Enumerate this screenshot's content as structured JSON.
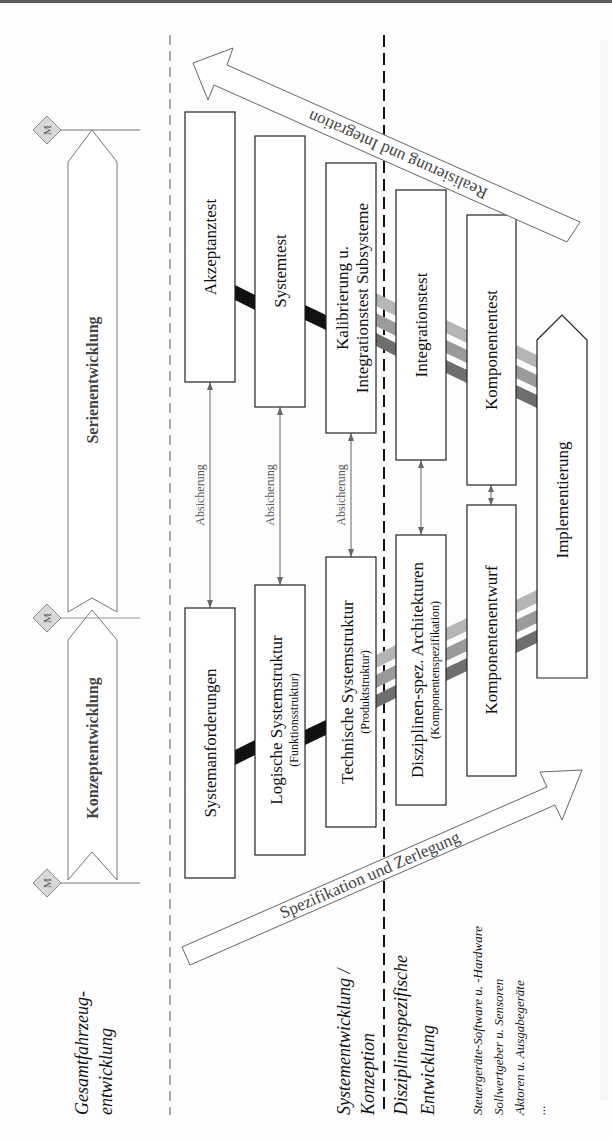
{
  "diagram": {
    "orientation": "rotated 90° counter-clockwise",
    "phases": {
      "series": "Serienentwicklung",
      "concept": "Konzeptentwicklung",
      "milestone_label": "M"
    },
    "left_branch": [
      {
        "label": "Systemanforderungen",
        "sub": ""
      },
      {
        "label": "Logische Systemstruktur",
        "sub": "(Funktionsstruktur)"
      },
      {
        "label": "Technische Systemstruktur",
        "sub": "(Produktstruktur)"
      },
      {
        "label": "Disziplinen-spez. Architekturen",
        "sub": "(Komponentenspezifikation)"
      },
      {
        "label": "Komponentenentwurf",
        "sub": ""
      }
    ],
    "right_branch": [
      {
        "label": "Akzeptanztest"
      },
      {
        "label": "Systemtest"
      },
      {
        "label": "Kalibrierung u.",
        "label2": "Integrationstest Subsysteme"
      },
      {
        "label": "Integrationstest"
      },
      {
        "label": "Komponententest"
      }
    ],
    "bottom": {
      "label": "Implementierung"
    },
    "verification_label": "Absicherung",
    "arrows": {
      "down": "Spezifikation und Zerlegung",
      "up": "Realisierung und Integration"
    },
    "lanes": {
      "vehicle": [
        "Gesamtfahrzeug-",
        "entwicklung"
      ],
      "system": [
        "Systementwicklung /",
        "Konzeption"
      ],
      "discipline": [
        "Disziplinenspezifische",
        "Entwicklung"
      ],
      "discipline_items": [
        "Steuergeräte-Software u. -Hardware",
        "Sollwertgeber u. Sensoren",
        "Aktoren u. Ausgabegeräte",
        "..."
      ]
    },
    "colors": {
      "band_black": "#111111",
      "band_light": "#b5b5b5",
      "band_mid": "#9a9a9a",
      "band_dark": "#6e6e6e",
      "milestone_fill": "#d8d8d8",
      "box_stroke": "#222222"
    }
  }
}
